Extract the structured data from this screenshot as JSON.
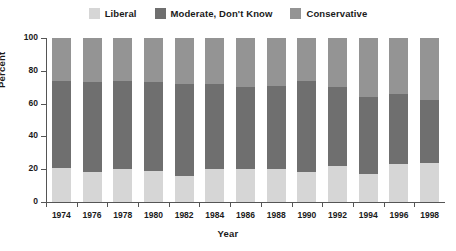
{
  "chart_data": {
    "type": "bar",
    "subtype": "stacked-bar-100",
    "title": "",
    "xlabel": "Year",
    "ylabel": "Percent",
    "ylim": [
      0,
      100
    ],
    "yticks": [
      0,
      20,
      40,
      60,
      80,
      100
    ],
    "grid": false,
    "legend_position": "top-center",
    "categories": [
      "1974",
      "1976",
      "1978",
      "1980",
      "1982",
      "1984",
      "1986",
      "1988",
      "1990",
      "1992",
      "1994",
      "1996",
      "1998"
    ],
    "series": [
      {
        "name": "Liberal",
        "color": "#d6d6d6",
        "values": [
          21,
          18,
          20,
          19,
          16,
          20,
          20,
          20,
          18,
          22,
          17,
          23,
          24
        ]
      },
      {
        "name": "Moderate, Don't Know",
        "color": "#6f6f6f",
        "values": [
          53,
          55,
          54,
          54,
          56,
          52,
          50,
          51,
          56,
          48,
          47,
          43,
          38
        ]
      },
      {
        "name": "Conservative",
        "color": "#949494",
        "values": [
          26,
          27,
          26,
          27,
          28,
          28,
          30,
          29,
          26,
          30,
          36,
          34,
          38
        ]
      }
    ],
    "legend": [
      {
        "label": "Liberal",
        "color": "#d6d6d6"
      },
      {
        "label": "Moderate, Don't Know",
        "color": "#6f6f6f"
      },
      {
        "label": "Conservative",
        "color": "#949494"
      }
    ]
  }
}
